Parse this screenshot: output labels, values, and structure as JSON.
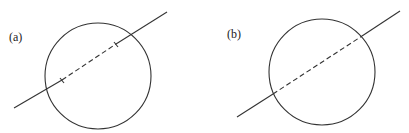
{
  "panels": [
    {
      "label": "(a)",
      "circle": {
        "cx": 98,
        "cy": 76,
        "r": 53
      },
      "line": {
        "x1": 14,
        "y1": 108,
        "x2": 167,
        "y2": 12
      },
      "dashed_segment": {
        "x1": 62,
        "y1": 80,
        "x2": 116,
        "y2": 44
      },
      "tick_marks": true
    },
    {
      "label": "(b)",
      "circle": {
        "cx": 117,
        "cy": 72,
        "r": 53
      },
      "line": {
        "x1": 32,
        "y1": 117,
        "x2": 195,
        "y2": 11
      },
      "dashed_segment": {
        "x1": 68,
        "y1": 94,
        "x2": 157,
        "y2": 36
      },
      "tick_marks": false
    }
  ],
  "colors": {
    "stroke": "#333333",
    "background": "#ffffff"
  }
}
